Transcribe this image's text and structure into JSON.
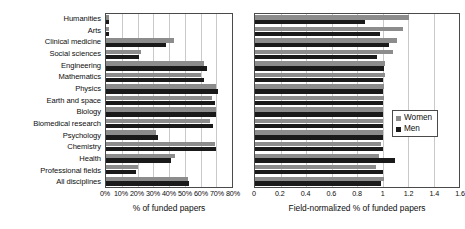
{
  "chart_data": {
    "type": "bar",
    "orientation": "horizontal",
    "title": "",
    "grid": true,
    "legend": {
      "position": "right-panel-inside",
      "entries": [
        {
          "name": "Women",
          "color": "#8c8c8c"
        },
        {
          "name": "Men",
          "color": "#1a1a1a"
        }
      ]
    },
    "categories": [
      "Humanities",
      "Arts",
      "Clinical medicine",
      "Social sciences",
      "Engineering",
      "Mathematics",
      "Physics",
      "Earth and space",
      "Biology",
      "Biomedical research",
      "Psychology",
      "Chemistry",
      "Health",
      "Professional fields",
      "All disciplines"
    ],
    "panels": [
      {
        "id": "left",
        "xlabel": "% of funded papers",
        "xlim": [
          0,
          80
        ],
        "xticks": [
          0,
          10,
          20,
          30,
          40,
          50,
          60,
          70,
          80
        ],
        "xticklabels": [
          "0%",
          "10%",
          "20%",
          "30%",
          "40%",
          "50%",
          "60%",
          "70%",
          "80%"
        ],
        "series": [
          {
            "name": "Women",
            "color": "#8c8c8c",
            "values": [
              2,
              2,
              43,
              22,
              62,
              60,
              70,
              67,
              70,
              66,
              32,
              69,
              44,
              20,
              52
            ]
          },
          {
            "name": "Men",
            "color": "#1a1a1a",
            "values": [
              2,
              2,
              38,
              21,
              64,
              62,
              71,
              69,
              70,
              68,
              33,
              70,
              41,
              19,
              53
            ]
          }
        ]
      },
      {
        "id": "right",
        "xlabel": "Field-normalized % of funded papers",
        "xlim": [
          0,
          1.6
        ],
        "xticks": [
          0,
          0.2,
          0.4,
          0.6,
          0.8,
          1.0,
          1.2,
          1.4,
          1.6
        ],
        "xticklabels": [
          "0",
          "0.2",
          "0.4",
          "0.6",
          "0.8",
          "1",
          "1.2",
          "1.4",
          "1.6"
        ],
        "series": [
          {
            "name": "Women",
            "color": "#8c8c8c",
            "values": [
              1.21,
              1.16,
              1.11,
              1.08,
              1.02,
              1.02,
              1.01,
              1.01,
              1.0,
              1.0,
              1.0,
              0.99,
              0.97,
              0.95,
              1.01
            ]
          },
          {
            "name": "Men",
            "color": "#1a1a1a",
            "values": [
              0.86,
              0.98,
              1.05,
              0.96,
              1.01,
              1.0,
              1.0,
              1.0,
              1.0,
              1.0,
              1.0,
              1.0,
              1.1,
              1.0,
              0.99
            ]
          }
        ]
      }
    ]
  }
}
